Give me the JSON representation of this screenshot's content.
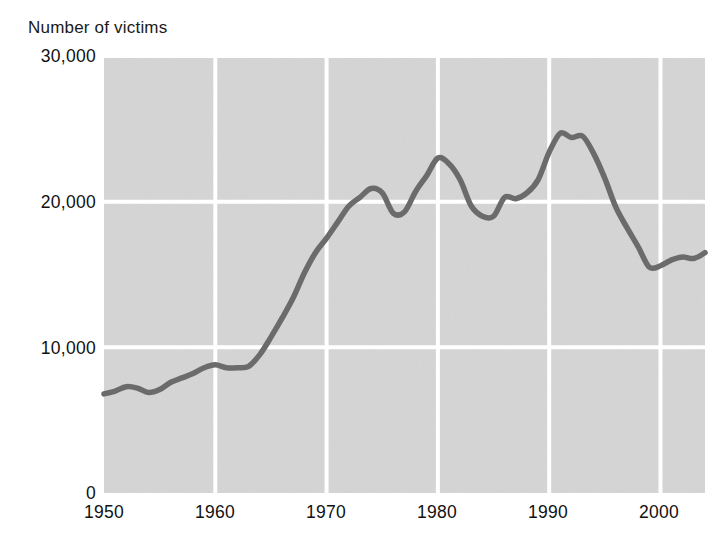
{
  "chart_data": {
    "type": "line",
    "title": "",
    "ylabel": "Number of victims",
    "xlabel": "",
    "xlim": [
      1950,
      2004
    ],
    "ylim": [
      0,
      30000
    ],
    "grid": true,
    "legend": null,
    "yticks": [
      0,
      10000,
      20000,
      30000
    ],
    "ytick_labels": [
      "0",
      "10,000",
      "20,000",
      "30,000"
    ],
    "xticks": [
      1950,
      1960,
      1970,
      1980,
      1990,
      2000
    ],
    "xtick_labels": [
      "1950",
      "1960",
      "1970",
      "1980",
      "1990",
      "2000"
    ],
    "series": [
      {
        "name": "Number of victims",
        "color": "#6b6b6b",
        "x": [
          1950,
          1951,
          1952,
          1953,
          1954,
          1955,
          1956,
          1957,
          1958,
          1959,
          1960,
          1961,
          1962,
          1963,
          1964,
          1965,
          1966,
          1967,
          1968,
          1969,
          1970,
          1971,
          1972,
          1973,
          1974,
          1975,
          1976,
          1977,
          1978,
          1979,
          1980,
          1981,
          1982,
          1983,
          1984,
          1985,
          1986,
          1987,
          1988,
          1989,
          1990,
          1991,
          1992,
          1993,
          1994,
          1995,
          1996,
          1997,
          1998,
          1999,
          2000,
          2001,
          2002,
          2003,
          2004
        ],
        "values": [
          6800,
          7000,
          7300,
          7200,
          6900,
          7100,
          7600,
          7900,
          8200,
          8600,
          8800,
          8600,
          8600,
          8700,
          9500,
          10700,
          12000,
          13400,
          15100,
          16500,
          17500,
          18600,
          19700,
          20300,
          20900,
          20600,
          19200,
          19300,
          20700,
          21800,
          23000,
          22600,
          21500,
          19700,
          19000,
          19000,
          20300,
          20200,
          20600,
          21500,
          23400,
          24700,
          24400,
          24500,
          23300,
          21600,
          19600,
          18200,
          16900,
          15500,
          15600,
          16000,
          16200,
          16100,
          16500
        ]
      }
    ],
    "annotations": []
  },
  "style": {
    "plot_background": "#d5d5d5",
    "gridline_color": "#ffffff",
    "line_color": "#6b6b6b",
    "text_color": "#111111",
    "page_background": "#ffffff"
  },
  "geometry": {
    "plot_left": 104,
    "plot_right": 705,
    "plot_top": 56,
    "plot_bottom": 493
  }
}
